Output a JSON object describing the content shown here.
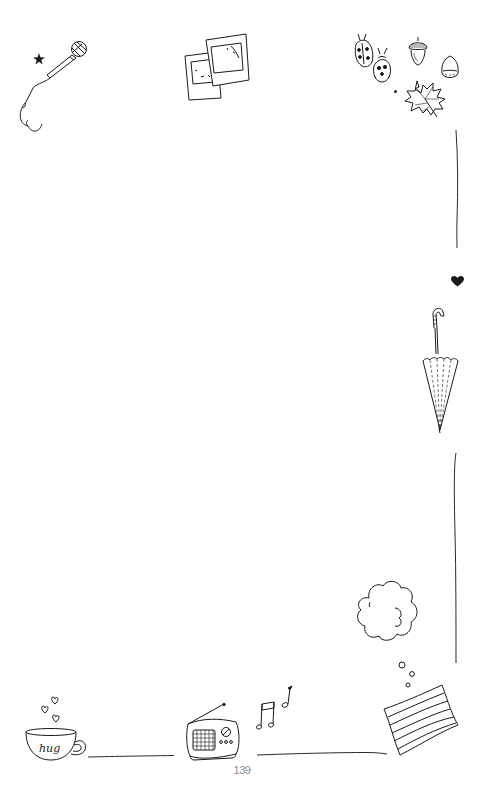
{
  "page": {
    "number": "139",
    "background": "#ffffff",
    "ink_color": "#1a1a1a"
  },
  "doodles": [
    {
      "id": "microphone",
      "icon": "microphone-icon",
      "position": "top-left"
    },
    {
      "id": "star",
      "icon": "star-icon",
      "position": "top-left"
    },
    {
      "id": "photos",
      "icon": "polaroid-photos-icon",
      "position": "top-center"
    },
    {
      "id": "ladybugs",
      "icon": "ladybug-icon",
      "position": "top-right"
    },
    {
      "id": "acorn",
      "icon": "acorn-icon",
      "position": "top-right"
    },
    {
      "id": "chestnut",
      "icon": "chestnut-icon",
      "position": "top-right"
    },
    {
      "id": "maple-leaf",
      "icon": "maple-leaf-icon",
      "position": "top-right"
    },
    {
      "id": "heart",
      "icon": "heart-icon",
      "position": "right"
    },
    {
      "id": "umbrella",
      "icon": "umbrella-icon",
      "position": "right"
    },
    {
      "id": "thought-cloud",
      "icon": "cloud-icon",
      "position": "bottom-right"
    },
    {
      "id": "pillow",
      "icon": "pillow-icon",
      "position": "bottom-right"
    },
    {
      "id": "mug",
      "icon": "mug-icon",
      "label": "hug",
      "position": "bottom-left"
    },
    {
      "id": "radio",
      "icon": "radio-icon",
      "position": "bottom-center"
    },
    {
      "id": "music-notes",
      "icon": "music-notes-icon",
      "position": "bottom-center"
    }
  ],
  "mug": {
    "label": "hug"
  }
}
